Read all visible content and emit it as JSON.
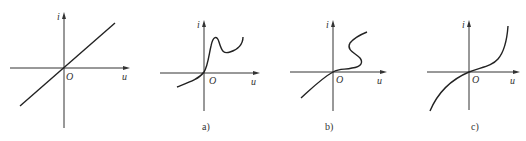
{
  "figure": {
    "panels": [
      {
        "id": "linear",
        "caption": "",
        "y_axis_label": "i",
        "x_axis_label": "u",
        "origin_label": "O",
        "curve": "straight line through origin"
      },
      {
        "id": "a",
        "caption": "a)",
        "y_axis_label": "i",
        "x_axis_label": "u",
        "origin_label": "O",
        "curve": "rising curve with peak then dip then rise"
      },
      {
        "id": "b",
        "caption": "b)",
        "y_axis_label": "i",
        "x_axis_label": "u",
        "origin_label": "O",
        "curve": "S-shaped curve folding back"
      },
      {
        "id": "c",
        "caption": "c)",
        "y_axis_label": "i",
        "x_axis_label": "u",
        "origin_label": "O",
        "curve": "cubic-like curve through origin"
      }
    ],
    "colors": {
      "axis": "#333333",
      "curve": "#222222",
      "background": "#ffffff"
    }
  }
}
